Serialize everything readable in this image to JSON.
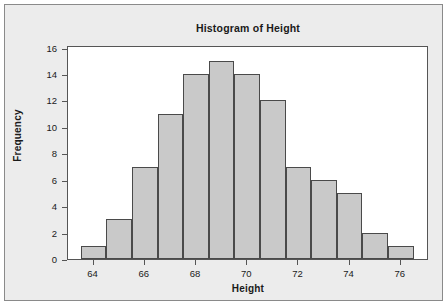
{
  "chart_data": {
    "type": "bar",
    "title": "Histogram of Height",
    "xlabel": "Height",
    "ylabel": "Frequency",
    "categories": [
      "64",
      "65",
      "66",
      "67",
      "68",
      "69",
      "70",
      "71",
      "72",
      "73",
      "74",
      "75",
      "76"
    ],
    "values": [
      1,
      3,
      7,
      11,
      14,
      15,
      14,
      12,
      7,
      6,
      5,
      2,
      1
    ],
    "bin_width": 1,
    "bin_edges": [
      63.5,
      64.5,
      65.5,
      66.5,
      67.5,
      68.5,
      69.5,
      70.5,
      71.5,
      72.5,
      73.5,
      74.5,
      75.5,
      76.5
    ],
    "xlim": [
      63.0,
      77.1
    ],
    "ylim": [
      0,
      16.2
    ],
    "xticks": [
      64,
      66,
      68,
      70,
      72,
      74,
      76
    ],
    "xtick_labels": [
      "64",
      "66",
      "68",
      "70",
      "72",
      "74",
      "76"
    ],
    "yticks": [
      0,
      2,
      4,
      6,
      8,
      10,
      12,
      14,
      16
    ],
    "ytick_labels": [
      "0",
      "2",
      "4",
      "6",
      "8",
      "10",
      "12",
      "14",
      "16"
    ],
    "grid": false,
    "legend": false,
    "colors": {
      "bar_fill": "#c9c9c9",
      "bar_edge": "#4a4a4a",
      "plot_background": "#ffffff",
      "figure_background": "#ececec",
      "frame": "#555555",
      "text": "#1a1a1a"
    }
  }
}
